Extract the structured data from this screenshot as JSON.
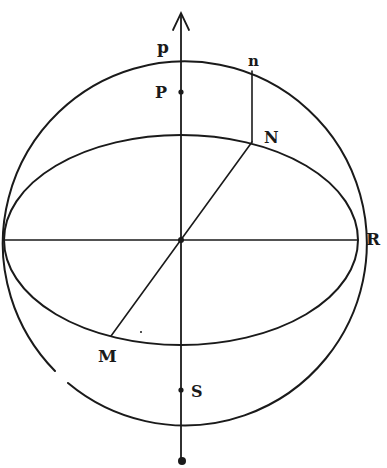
{
  "diagram": {
    "type": "celestial-sphere-geometry",
    "colors": {
      "ink": "#1a1a1a",
      "background": "#ffffff"
    },
    "labels": {
      "p_upper": "p",
      "P": "P",
      "n": "n",
      "N": "N",
      "R": "R",
      "M": "M",
      "S": "S"
    },
    "elements": {
      "outer_circle": {
        "cx": 181,
        "cy": 240,
        "r": 182
      },
      "equator_ellipse": {
        "cx": 181,
        "cy": 240,
        "rx": 177,
        "ry": 105
      },
      "axis": {
        "x": 181,
        "y_top": 12,
        "y_bottom": 462,
        "arrow": "up"
      },
      "points": [
        "P",
        "S",
        "center",
        "bottom-dot"
      ]
    }
  }
}
